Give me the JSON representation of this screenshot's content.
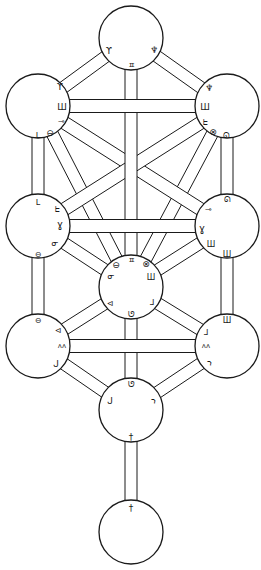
{
  "diagram": {
    "type": "tree-of-life",
    "canvas": {
      "width": 261,
      "height": 570,
      "background": "#ffffff",
      "stroke": "#1a1a1a"
    },
    "node_radius": 32,
    "nodes": [
      {
        "id": "kether",
        "x": 131,
        "y": 38
      },
      {
        "id": "chokmah",
        "x": 227,
        "y": 106
      },
      {
        "id": "binah",
        "x": 38,
        "y": 106
      },
      {
        "id": "chesed",
        "x": 227,
        "y": 226
      },
      {
        "id": "geburah",
        "x": 38,
        "y": 226
      },
      {
        "id": "tiphareth",
        "x": 131,
        "y": 287
      },
      {
        "id": "netzach",
        "x": 227,
        "y": 346
      },
      {
        "id": "hod",
        "x": 38,
        "y": 346
      },
      {
        "id": "yesod",
        "x": 131,
        "y": 410
      },
      {
        "id": "malkuth",
        "x": 131,
        "y": 532
      }
    ],
    "paths": [
      {
        "from": "kether",
        "to": "binah",
        "width": 12,
        "layer": 1
      },
      {
        "from": "kether",
        "to": "chokmah",
        "width": 12,
        "layer": 1
      },
      {
        "from": "binah",
        "to": "tiphareth",
        "width": 12,
        "layer": 0
      },
      {
        "from": "chokmah",
        "to": "tiphareth",
        "width": 12,
        "layer": 0
      },
      {
        "from": "binah",
        "to": "geburah",
        "width": 12,
        "layer": 1
      },
      {
        "from": "chokmah",
        "to": "chesed",
        "width": 12,
        "layer": 1
      },
      {
        "from": "geburah",
        "to": "hod",
        "width": 12,
        "layer": 1
      },
      {
        "from": "chesed",
        "to": "netzach",
        "width": 12,
        "layer": 1
      },
      {
        "from": "geburah",
        "to": "tiphareth",
        "width": 12,
        "layer": 1
      },
      {
        "from": "chesed",
        "to": "tiphareth",
        "width": 12,
        "layer": 1
      },
      {
        "from": "tiphareth",
        "to": "hod",
        "width": 12,
        "layer": 1
      },
      {
        "from": "tiphareth",
        "to": "netzach",
        "width": 12,
        "layer": 1
      },
      {
        "from": "hod",
        "to": "yesod",
        "width": 12,
        "layer": 1
      },
      {
        "from": "netzach",
        "to": "yesod",
        "width": 12,
        "layer": 1
      },
      {
        "from": "binah",
        "to": "chesed",
        "width": 13,
        "layer": 2
      },
      {
        "from": "chokmah",
        "to": "geburah",
        "width": 13,
        "layer": 3
      },
      {
        "from": "tiphareth",
        "to": "yesod",
        "width": 12,
        "layer": 2
      },
      {
        "from": "yesod",
        "to": "malkuth",
        "width": 12,
        "layer": 2
      },
      {
        "from": "kether",
        "to": "tiphareth",
        "width": 12,
        "layer": 4
      },
      {
        "from": "binah",
        "to": "chokmah",
        "width": 13,
        "layer": 5
      },
      {
        "from": "geburah",
        "to": "chesed",
        "width": 13,
        "layer": 5
      },
      {
        "from": "hod",
        "to": "netzach",
        "width": 13,
        "layer": 5
      }
    ],
    "glyphs": [
      {
        "node": "kether",
        "char": "ϒ",
        "x": 109,
        "y": 51,
        "size": 9
      },
      {
        "node": "kether",
        "char": "♆",
        "x": 154,
        "y": 50,
        "size": 9
      },
      {
        "node": "kether",
        "char": "ㅍ",
        "x": 131,
        "y": 65,
        "size": 8
      },
      {
        "node": "binah",
        "char": "ϒ",
        "x": 60,
        "y": 87,
        "size": 9
      },
      {
        "node": "binah",
        "char": "Ш",
        "x": 62,
        "y": 107,
        "size": 9
      },
      {
        "node": "binah",
        "char": "⊸",
        "x": 61,
        "y": 121,
        "size": 8
      },
      {
        "node": "binah",
        "char": "⊖",
        "x": 50,
        "y": 133,
        "size": 9
      },
      {
        "node": "binah",
        "char": "ᒪ",
        "x": 38,
        "y": 135,
        "size": 8
      },
      {
        "node": "chokmah",
        "char": "♆",
        "x": 209,
        "y": 88,
        "size": 9
      },
      {
        "node": "chokmah",
        "char": "Ш",
        "x": 205,
        "y": 107,
        "size": 9
      },
      {
        "node": "chokmah",
        "char": "ᖶ",
        "x": 205,
        "y": 122,
        "size": 8
      },
      {
        "node": "chokmah",
        "char": "⊗",
        "x": 213,
        "y": 132,
        "size": 9
      },
      {
        "node": "chokmah",
        "char": "ᘏ",
        "x": 226,
        "y": 135,
        "size": 8
      },
      {
        "node": "geburah",
        "char": "ᒪ",
        "x": 38,
        "y": 202,
        "size": 8
      },
      {
        "node": "geburah",
        "char": "ᖶ",
        "x": 57,
        "y": 209,
        "size": 8
      },
      {
        "node": "geburah",
        "char": "ɣ",
        "x": 60,
        "y": 224,
        "size": 10
      },
      {
        "node": "geburah",
        "char": "ᓂ",
        "x": 55,
        "y": 243,
        "size": 8
      },
      {
        "node": "geburah",
        "char": "⊖",
        "x": 38,
        "y": 254,
        "size": 8
      },
      {
        "node": "chesed",
        "char": "ᘏ",
        "x": 227,
        "y": 199,
        "size": 8
      },
      {
        "node": "chesed",
        "char": "⊸",
        "x": 208,
        "y": 209,
        "size": 8
      },
      {
        "node": "chesed",
        "char": "ɣ",
        "x": 202,
        "y": 228,
        "size": 10
      },
      {
        "node": "chesed",
        "char": "Ш",
        "x": 211,
        "y": 244,
        "size": 8
      },
      {
        "node": "chesed",
        "char": "Ш",
        "x": 227,
        "y": 254,
        "size": 8
      },
      {
        "node": "tiphareth",
        "char": "ㅍ",
        "x": 131,
        "y": 260,
        "size": 8
      },
      {
        "node": "tiphareth",
        "char": "⊖",
        "x": 116,
        "y": 265,
        "size": 9
      },
      {
        "node": "tiphareth",
        "char": "⊗",
        "x": 146,
        "y": 264,
        "size": 9
      },
      {
        "node": "tiphareth",
        "char": "ᓂ",
        "x": 111,
        "y": 276,
        "size": 8
      },
      {
        "node": "tiphareth",
        "char": "Ш",
        "x": 151,
        "y": 277,
        "size": 8
      },
      {
        "node": "tiphareth",
        "char": "⊲",
        "x": 110,
        "y": 303,
        "size": 8
      },
      {
        "node": "tiphareth",
        "char": "ᒧ",
        "x": 152,
        "y": 302,
        "size": 8
      },
      {
        "node": "tiphareth",
        "char": "ᘎ",
        "x": 131,
        "y": 314,
        "size": 8
      },
      {
        "node": "hod",
        "char": "⊖",
        "x": 38,
        "y": 320,
        "size": 8
      },
      {
        "node": "hod",
        "char": "⊲",
        "x": 58,
        "y": 330,
        "size": 8
      },
      {
        "node": "hod",
        "char": "ᴧᴧ",
        "x": 62,
        "y": 346,
        "size": 7
      },
      {
        "node": "hod",
        "char": "ᒍ",
        "x": 56,
        "y": 364,
        "size": 9
      },
      {
        "node": "netzach",
        "char": "Ш",
        "x": 227,
        "y": 320,
        "size": 8
      },
      {
        "node": "netzach",
        "char": "ᒧ",
        "x": 206,
        "y": 332,
        "size": 8
      },
      {
        "node": "netzach",
        "char": "ᴧᴧ",
        "x": 206,
        "y": 346,
        "size": 7
      },
      {
        "node": "netzach",
        "char": "ኀ",
        "x": 209,
        "y": 363,
        "size": 8
      },
      {
        "node": "yesod",
        "char": "ᘎ",
        "x": 131,
        "y": 384,
        "size": 8
      },
      {
        "node": "yesod",
        "char": "ᒍ",
        "x": 110,
        "y": 401,
        "size": 9
      },
      {
        "node": "yesod",
        "char": "ኀ",
        "x": 153,
        "y": 401,
        "size": 8
      },
      {
        "node": "yesod",
        "char": "†",
        "x": 131,
        "y": 437,
        "size": 9
      },
      {
        "node": "malkuth",
        "char": "†",
        "x": 131,
        "y": 508,
        "size": 9
      }
    ]
  }
}
